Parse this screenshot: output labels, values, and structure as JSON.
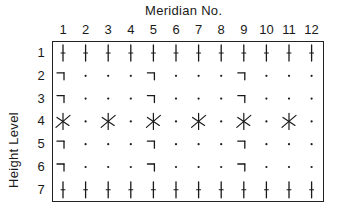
{
  "title": "Meridian No.",
  "y_axis_label": "Height Level",
  "columns": [
    "1",
    "2",
    "3",
    "4",
    "5",
    "6",
    "7",
    "8",
    "9",
    "10",
    "11",
    "12"
  ],
  "rows": [
    "1",
    "2",
    "3",
    "4",
    "5",
    "6",
    "7"
  ],
  "symbol_legend": {
    "tick": "vertical line with small crossbar",
    "angle": "horizontal bar with downward stroke (¬)",
    "star": "X crossed with vertical stroke",
    "dot": "small dot"
  },
  "grid": [
    [
      "tick",
      "tick",
      "tick",
      "tick",
      "tick",
      "tick",
      "tick",
      "tick",
      "tick",
      "tick",
      "tick",
      "tick"
    ],
    [
      "angle",
      "dot",
      "dot",
      "dot",
      "angle",
      "dot",
      "dot",
      "dot",
      "angle",
      "dot",
      "dot",
      "dot"
    ],
    [
      "angle",
      "dot",
      "dot",
      "dot",
      "angle",
      "dot",
      "dot",
      "dot",
      "angle",
      "dot",
      "dot",
      "dot"
    ],
    [
      "star",
      "dot",
      "star",
      "dot",
      "star",
      "dot",
      "star",
      "dot",
      "star",
      "dot",
      "star",
      "dot"
    ],
    [
      "angle",
      "dot",
      "dot",
      "dot",
      "angle",
      "dot",
      "dot",
      "dot",
      "angle",
      "dot",
      "dot",
      "dot"
    ],
    [
      "angle",
      "dot",
      "dot",
      "dot",
      "angle",
      "dot",
      "dot",
      "dot",
      "angle",
      "dot",
      "dot",
      "dot"
    ],
    [
      "tick",
      "tick",
      "tick",
      "tick",
      "tick",
      "tick",
      "tick",
      "tick",
      "tick",
      "tick",
      "tick",
      "tick"
    ]
  ],
  "colors": {
    "ink": "#1a1a1a",
    "background": "#ffffff"
  }
}
